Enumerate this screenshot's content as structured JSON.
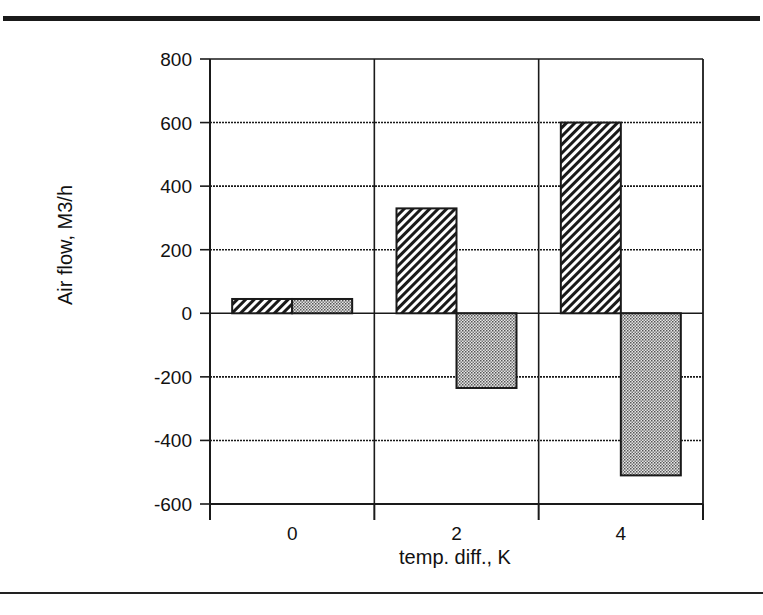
{
  "chart_data": {
    "type": "bar",
    "title": "",
    "xlabel": "temp. diff., K",
    "ylabel": "Air flow, M3/h",
    "categories": [
      "0",
      "2",
      "4"
    ],
    "series": [
      {
        "name": "hatched",
        "pattern": "diagonal-hatch",
        "values": [
          45,
          330,
          600
        ]
      },
      {
        "name": "dotted",
        "pattern": "dotted-gray",
        "values": [
          45,
          -235,
          -510
        ]
      }
    ],
    "ylim": [
      -600,
      800
    ],
    "yticks": [
      800,
      600,
      400,
      200,
      0,
      -200,
      -400,
      -600
    ],
    "grid": true,
    "legend": null
  },
  "colors": {
    "line": "#1a1a1a",
    "background": "#ffffff",
    "dot_fill": "#bdbdbd"
  }
}
